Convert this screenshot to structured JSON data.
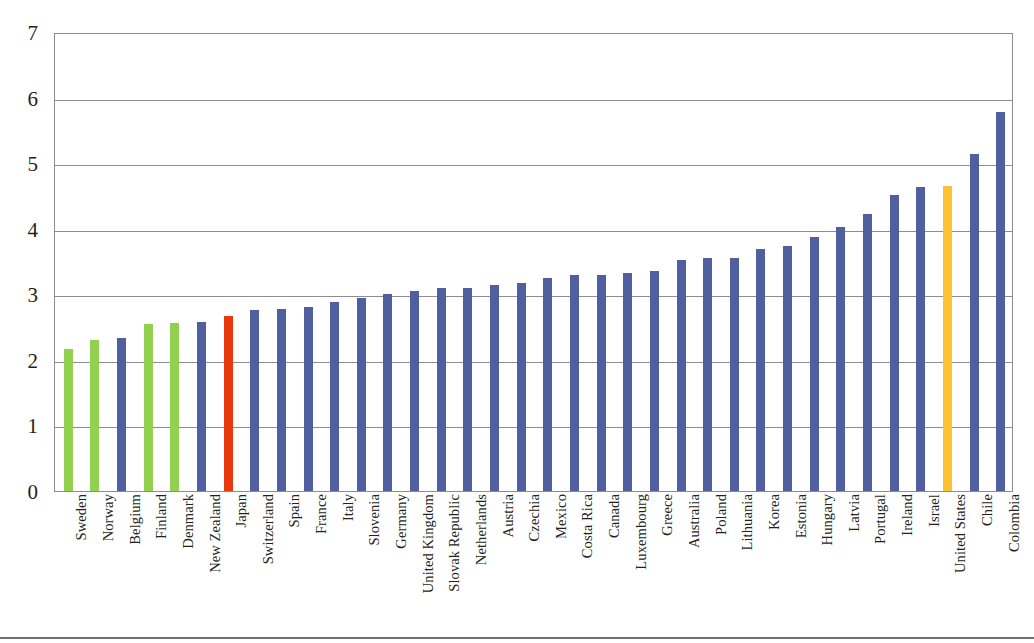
{
  "chart_data": {
    "type": "bar",
    "title": "",
    "subtitle": "",
    "xlabel": "",
    "ylabel": "",
    "ylim": [
      0,
      7
    ],
    "yticks": [
      0,
      1,
      2,
      3,
      4,
      5,
      6,
      7
    ],
    "ytick_labels": [
      "0",
      "1",
      "2",
      "3",
      "4",
      "5",
      "6",
      "7"
    ],
    "grid": true,
    "grid_axis": "y",
    "legend": false,
    "legend_position": "none",
    "orientation": "vertical",
    "sorted": "ascending",
    "categories": [
      "Sweden",
      "Norway",
      "Belgium",
      "Finland",
      "Denmark",
      "New Zealand",
      "Japan",
      "Switzerland",
      "Spain",
      "France",
      "Italy",
      "Slovenia",
      "Germany",
      "United Kingdom",
      "Slovak Republic",
      "Netherlands",
      "Austria",
      "Czechia",
      "Mexico",
      "Costa Rica",
      "Canada",
      "Luxembourg",
      "Greece",
      "Australia",
      "Poland",
      "Lithuania",
      "Korea",
      "Estonia",
      "Hungary",
      "Latvia",
      "Portugal",
      "Ireland",
      "Israel",
      "United States",
      "Chile",
      "Colombia"
    ],
    "values": [
      2.16,
      2.31,
      2.33,
      2.55,
      2.56,
      2.58,
      2.67,
      2.76,
      2.78,
      2.81,
      2.88,
      2.95,
      3.0,
      3.05,
      3.09,
      3.1,
      3.14,
      3.17,
      3.25,
      3.29,
      3.3,
      3.32,
      3.35,
      3.53,
      3.55,
      3.55,
      3.69,
      3.74,
      3.87,
      4.03,
      4.23,
      4.51,
      4.64,
      4.65,
      5.14,
      5.78
    ],
    "bar_colors": [
      "#92d050",
      "#92d050",
      "#4f5fa0",
      "#92d050",
      "#92d050",
      "#4f5fa0",
      "#e8380d",
      "#4f5fa0",
      "#4f5fa0",
      "#4f5fa0",
      "#4f5fa0",
      "#4f5fa0",
      "#4f5fa0",
      "#4f5fa0",
      "#4f5fa0",
      "#4f5fa0",
      "#4f5fa0",
      "#4f5fa0",
      "#4f5fa0",
      "#4f5fa0",
      "#4f5fa0",
      "#4f5fa0",
      "#4f5fa0",
      "#4f5fa0",
      "#4f5fa0",
      "#4f5fa0",
      "#4f5fa0",
      "#4f5fa0",
      "#4f5fa0",
      "#4f5fa0",
      "#4f5fa0",
      "#4f5fa0",
      "#4f5fa0",
      "#fdc132",
      "#4f5fa0",
      "#4f5fa0"
    ],
    "colors": {
      "default_bar": "#4f5fa0",
      "highlight_green": "#92d050",
      "highlight_red": "#e8380d",
      "highlight_orange": "#fdc132",
      "gridline": "#8d8d8d",
      "axis_text": "#231f20",
      "plot_background": "#ffffff",
      "bottom_rule": "#6f6f6f"
    }
  }
}
